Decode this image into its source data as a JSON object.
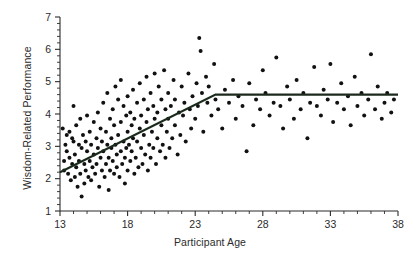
{
  "chart_data": {
    "type": "scatter",
    "title": "",
    "xlabel": "Participant Age",
    "ylabel": "Wisdom-Related Performance",
    "xlim": [
      13,
      38
    ],
    "ylim": [
      1,
      7
    ],
    "xticks": [
      13,
      18,
      23,
      28,
      33,
      38
    ],
    "yticks": [
      1,
      2,
      3,
      4,
      5,
      6,
      7
    ],
    "xtick_labels": [
      "13",
      "18",
      "23",
      "28",
      "33",
      "38"
    ],
    "ytick_labels": [
      "1",
      "2",
      "3",
      "4",
      "5",
      "6",
      "7"
    ],
    "x_minor_ticks_per_interval": 4,
    "y_minor_ticks_per_interval": 4,
    "grid": false,
    "legend": null,
    "marker": {
      "shape": "circle",
      "color": "#111111",
      "size": 2.6
    },
    "series": [
      {
        "name": "Participants",
        "points": [
          [
            13.2,
            3.55
          ],
          [
            13.3,
            2.55
          ],
          [
            13.3,
            2.25
          ],
          [
            13.4,
            3.05
          ],
          [
            13.5,
            3.35
          ],
          [
            13.5,
            2.85
          ],
          [
            13.6,
            2.15
          ],
          [
            13.7,
            3.45
          ],
          [
            13.7,
            2.65
          ],
          [
            13.8,
            1.95
          ],
          [
            13.9,
            3.25
          ],
          [
            13.9,
            2.45
          ],
          [
            14.0,
            4.25
          ],
          [
            14.0,
            3.15
          ],
          [
            14.1,
            2.75
          ],
          [
            14.1,
            2.05
          ],
          [
            14.2,
            3.65
          ],
          [
            14.2,
            2.35
          ],
          [
            14.3,
            1.75
          ],
          [
            14.4,
            3.05
          ],
          [
            14.4,
            2.55
          ],
          [
            14.5,
            3.85
          ],
          [
            14.5,
            2.15
          ],
          [
            14.6,
            2.95
          ],
          [
            14.6,
            1.45
          ],
          [
            14.7,
            3.35
          ],
          [
            14.8,
            2.45
          ],
          [
            14.8,
            1.85
          ],
          [
            14.9,
            3.15
          ],
          [
            14.9,
            2.25
          ],
          [
            15.0,
            3.95
          ],
          [
            15.0,
            2.85
          ],
          [
            15.1,
            2.05
          ],
          [
            15.2,
            3.45
          ],
          [
            15.2,
            2.55
          ],
          [
            15.3,
            3.05
          ],
          [
            15.3,
            1.95
          ],
          [
            15.4,
            2.35
          ],
          [
            15.5,
            3.75
          ],
          [
            15.5,
            2.75
          ],
          [
            15.6,
            2.15
          ],
          [
            15.7,
            3.25
          ],
          [
            15.7,
            2.45
          ],
          [
            15.8,
            4.05
          ],
          [
            15.8,
            2.95
          ],
          [
            15.9,
            1.75
          ],
          [
            16.0,
            3.55
          ],
          [
            16.0,
            2.65
          ],
          [
            16.1,
            2.25
          ],
          [
            16.1,
            3.15
          ],
          [
            16.2,
            4.35
          ],
          [
            16.2,
            2.85
          ],
          [
            16.3,
            2.05
          ],
          [
            16.4,
            3.45
          ],
          [
            16.4,
            2.45
          ],
          [
            16.5,
            4.65
          ],
          [
            16.5,
            3.05
          ],
          [
            16.6,
            2.65
          ],
          [
            16.6,
            1.65
          ],
          [
            16.7,
            3.85
          ],
          [
            16.7,
            2.25
          ],
          [
            16.8,
            3.25
          ],
          [
            16.8,
            2.95
          ],
          [
            16.9,
            4.15
          ],
          [
            16.9,
            2.55
          ],
          [
            17.0,
            3.65
          ],
          [
            17.0,
            2.15
          ],
          [
            17.1,
            4.85
          ],
          [
            17.1,
            3.05
          ],
          [
            17.2,
            2.75
          ],
          [
            17.2,
            2.35
          ],
          [
            17.3,
            4.45
          ],
          [
            17.3,
            3.35
          ],
          [
            17.4,
            2.05
          ],
          [
            17.5,
            5.05
          ],
          [
            17.5,
            3.75
          ],
          [
            17.5,
            2.85
          ],
          [
            17.6,
            2.45
          ],
          [
            17.7,
            4.25
          ],
          [
            17.7,
            3.15
          ],
          [
            17.8,
            2.65
          ],
          [
            17.8,
            1.85
          ],
          [
            17.9,
            3.95
          ],
          [
            17.9,
            2.95
          ],
          [
            18.0,
            4.55
          ],
          [
            18.0,
            3.45
          ],
          [
            18.0,
            2.25
          ],
          [
            18.1,
            3.05
          ],
          [
            18.2,
            4.05
          ],
          [
            18.2,
            2.55
          ],
          [
            18.3,
            3.65
          ],
          [
            18.3,
            2.85
          ],
          [
            18.4,
            4.75
          ],
          [
            18.4,
            3.25
          ],
          [
            18.5,
            2.15
          ],
          [
            18.5,
            3.85
          ],
          [
            18.6,
            2.65
          ],
          [
            18.7,
            4.35
          ],
          [
            18.7,
            3.15
          ],
          [
            18.8,
            2.35
          ],
          [
            18.9,
            3.55
          ],
          [
            18.9,
            4.95
          ],
          [
            19.0,
            2.95
          ],
          [
            19.0,
            3.95
          ],
          [
            19.1,
            2.45
          ],
          [
            19.2,
            4.45
          ],
          [
            19.2,
            3.35
          ],
          [
            19.3,
            2.75
          ],
          [
            19.4,
            5.15
          ],
          [
            19.4,
            3.75
          ],
          [
            19.5,
            2.25
          ],
          [
            19.5,
            4.15
          ],
          [
            19.6,
            3.05
          ],
          [
            19.7,
            4.65
          ],
          [
            19.7,
            2.65
          ],
          [
            19.8,
            3.45
          ],
          [
            19.9,
            4.25
          ],
          [
            19.9,
            2.95
          ],
          [
            20.0,
            3.85
          ],
          [
            20.0,
            5.25
          ],
          [
            20.1,
            2.45
          ],
          [
            20.2,
            4.05
          ],
          [
            20.2,
            3.25
          ],
          [
            20.3,
            4.85
          ],
          [
            20.4,
            2.85
          ],
          [
            20.5,
            3.65
          ],
          [
            20.5,
            4.45
          ],
          [
            20.6,
            3.05
          ],
          [
            20.7,
            5.35
          ],
          [
            20.8,
            4.15
          ],
          [
            20.8,
            2.65
          ],
          [
            20.9,
            3.45
          ],
          [
            21.0,
            4.65
          ],
          [
            21.0,
            3.85
          ],
          [
            21.1,
            2.95
          ],
          [
            21.2,
            4.25
          ],
          [
            21.3,
            3.25
          ],
          [
            21.4,
            5.05
          ],
          [
            21.5,
            4.45
          ],
          [
            21.5,
            3.65
          ],
          [
            21.7,
            2.75
          ],
          [
            21.8,
            4.05
          ],
          [
            21.9,
            3.35
          ],
          [
            22.0,
            4.85
          ],
          [
            22.1,
            3.95
          ],
          [
            22.2,
            4.35
          ],
          [
            22.3,
            3.15
          ],
          [
            22.5,
            5.25
          ],
          [
            22.6,
            4.15
          ],
          [
            22.7,
            3.55
          ],
          [
            22.8,
            4.55
          ],
          [
            23.0,
            3.85
          ],
          [
            23.1,
            4.95
          ],
          [
            23.2,
            4.25
          ],
          [
            23.3,
            6.35
          ],
          [
            23.4,
            5.95
          ],
          [
            23.5,
            4.65
          ],
          [
            23.6,
            3.45
          ],
          [
            23.8,
            5.15
          ],
          [
            23.9,
            4.35
          ],
          [
            24.0,
            4.85
          ],
          [
            24.2,
            3.95
          ],
          [
            24.4,
            5.55
          ],
          [
            24.5,
            4.45
          ],
          [
            24.7,
            4.15
          ],
          [
            25.0,
            3.55
          ],
          [
            25.2,
            4.75
          ],
          [
            25.5,
            4.35
          ],
          [
            25.8,
            5.05
          ],
          [
            26.0,
            3.85
          ],
          [
            26.2,
            4.55
          ],
          [
            26.5,
            4.25
          ],
          [
            26.8,
            2.85
          ],
          [
            27.0,
            4.95
          ],
          [
            27.3,
            3.65
          ],
          [
            27.5,
            4.45
          ],
          [
            27.8,
            4.15
          ],
          [
            28.0,
            5.35
          ],
          [
            28.2,
            4.65
          ],
          [
            28.5,
            3.95
          ],
          [
            28.8,
            4.35
          ],
          [
            29.0,
            5.75
          ],
          [
            29.3,
            4.25
          ],
          [
            29.5,
            3.55
          ],
          [
            29.8,
            4.85
          ],
          [
            30.0,
            4.45
          ],
          [
            30.3,
            3.85
          ],
          [
            30.5,
            5.05
          ],
          [
            30.8,
            4.15
          ],
          [
            31.0,
            4.65
          ],
          [
            31.3,
            3.25
          ],
          [
            31.5,
            4.35
          ],
          [
            31.8,
            5.45
          ],
          [
            32.0,
            4.25
          ],
          [
            32.3,
            3.95
          ],
          [
            32.5,
            4.75
          ],
          [
            32.8,
            4.45
          ],
          [
            33.0,
            5.55
          ],
          [
            33.2,
            3.75
          ],
          [
            33.5,
            4.35
          ],
          [
            33.8,
            4.95
          ],
          [
            34.0,
            4.15
          ],
          [
            34.3,
            4.55
          ],
          [
            34.5,
            3.65
          ],
          [
            34.8,
            5.15
          ],
          [
            35.0,
            4.25
          ],
          [
            35.3,
            4.65
          ],
          [
            35.5,
            3.95
          ],
          [
            35.8,
            4.45
          ],
          [
            36.0,
            5.85
          ],
          [
            36.3,
            4.15
          ],
          [
            36.5,
            4.85
          ],
          [
            36.8,
            3.85
          ],
          [
            37.0,
            4.35
          ],
          [
            37.2,
            4.65
          ],
          [
            37.5,
            4.05
          ],
          [
            37.7,
            4.45
          ]
        ]
      }
    ],
    "fit_line": {
      "name": "Segmented regression",
      "color": "#1c2a1c",
      "breakpoint_x": 24.5,
      "vertices": [
        [
          13,
          2.2
        ],
        [
          24.5,
          4.6
        ],
        [
          38,
          4.6
        ]
      ]
    }
  }
}
